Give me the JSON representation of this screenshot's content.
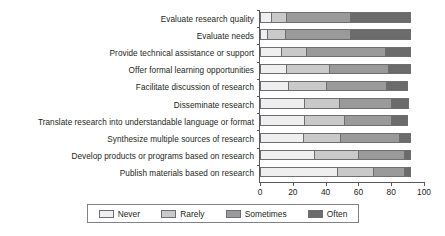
{
  "chart_data": {
    "type": "bar",
    "orientation": "horizontal",
    "stacked": true,
    "title": "",
    "xlabel": "",
    "ylabel": "",
    "xlim": [
      0,
      100
    ],
    "xticks": [
      0,
      20,
      40,
      60,
      80,
      100
    ],
    "xticklabels": [
      "0",
      "20",
      "40",
      "60",
      "80",
      "100"
    ],
    "grid": false,
    "legend_position": "bottom",
    "categories": [
      "Evaluate research quality",
      "Evaluate needs",
      "Provide technical assistance or support",
      "Offer formal learning opportunities",
      "Facilitate discussion of research",
      "Disseminate research",
      "Translate research into understandable language or format",
      "Synthesize multiple sources of research",
      "Develop products or programs based on research",
      "Publish materials based on research"
    ],
    "series": [
      {
        "name": "Never",
        "color": "#efefef",
        "values": [
          7,
          4,
          13,
          16,
          17,
          27,
          27,
          26,
          33,
          47
        ]
      },
      {
        "name": "Rarely",
        "color": "#c9c9c9",
        "values": [
          9,
          11,
          15,
          26,
          23,
          21,
          24,
          23,
          27,
          22
        ]
      },
      {
        "name": "Sometimes",
        "color": "#9a9a9a",
        "values": [
          39,
          40,
          48,
          36,
          37,
          32,
          29,
          36,
          28,
          19
        ]
      },
      {
        "name": "Often",
        "color": "#6b6b6b",
        "values": [
          37,
          37,
          16,
          14,
          13,
          11,
          10,
          7,
          4,
          4
        ]
      }
    ],
    "totals": [
      92,
      92,
      92,
      92,
      90,
      91,
      90,
      92,
      92,
      92
    ]
  },
  "legend": {
    "items": [
      {
        "label": "Never",
        "color": "#efefef"
      },
      {
        "label": "Rarely",
        "color": "#c9c9c9"
      },
      {
        "label": "Sometimes",
        "color": "#9a9a9a"
      },
      {
        "label": "Often",
        "color": "#6b6b6b"
      }
    ]
  }
}
